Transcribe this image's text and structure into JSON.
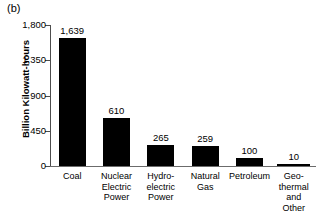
{
  "figure": {
    "panel_label": "(b)"
  },
  "chart_data": {
    "type": "bar",
    "title": "",
    "xlabel": "",
    "ylabel": "Billion Kilowatt-hours",
    "ylim": [
      0,
      1800
    ],
    "yticks": [
      0,
      450,
      900,
      1350,
      1800
    ],
    "ytick_labels": [
      "0",
      "450",
      "900",
      "1,350",
      "1,800"
    ],
    "grid": false,
    "legend": false,
    "bar_color": "#000000",
    "categories": [
      "Coal",
      "Nuclear\nElectric\nPower",
      "Hydro-\nelectric\nPower",
      "Natural\nGas",
      "Petroleum",
      "Geo-\nthermal\nand\nOther"
    ],
    "values": [
      1639,
      610,
      265,
      259,
      100,
      10
    ],
    "value_labels": [
      "1,639",
      "610",
      "265",
      "259",
      "100",
      "10"
    ]
  }
}
